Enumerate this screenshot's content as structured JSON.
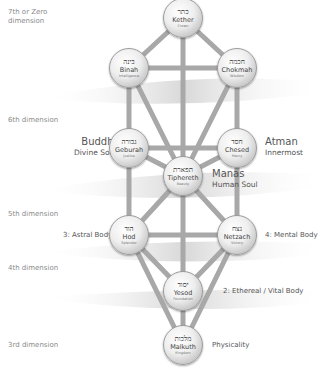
{
  "dimensions": [
    {
      "label": "7th or Zero\ndimension",
      "y": 13
    },
    {
      "label": "6th dimension",
      "y": 120
    },
    {
      "label": "5th dimension",
      "y": 214
    },
    {
      "label": "4th dimension",
      "y": 268
    },
    {
      "label": "3rd dimension",
      "y": 345
    }
  ],
  "sephiroth": [
    {
      "id": "kether",
      "hebrew": "כתר",
      "name": "Kether",
      "meaning": "Crown",
      "x": 183,
      "y": 18
    },
    {
      "id": "binah",
      "hebrew": "בינה",
      "name": "Binah",
      "meaning": "Intelligence",
      "x": 129,
      "y": 68
    },
    {
      "id": "chokmah",
      "hebrew": "חכמה",
      "name": "Chokmah",
      "meaning": "Wisdom",
      "x": 237,
      "y": 68
    },
    {
      "id": "geburah",
      "hebrew": "גבורה",
      "name": "Geburah",
      "meaning": "Justice",
      "x": 129,
      "y": 148
    },
    {
      "id": "chesed",
      "hebrew": "חסד",
      "name": "Chesed",
      "meaning": "Mercy",
      "x": 237,
      "y": 148
    },
    {
      "id": "tiphereth",
      "hebrew": "תפארת",
      "name": "Tiphereth",
      "meaning": "Beauty",
      "x": 183,
      "y": 176
    },
    {
      "id": "hod",
      "hebrew": "הוד",
      "name": "Hod",
      "meaning": "Splendor",
      "x": 129,
      "y": 235
    },
    {
      "id": "netzach",
      "hebrew": "נצח",
      "name": "Netzach",
      "meaning": "Victory",
      "x": 237,
      "y": 235
    },
    {
      "id": "yesod",
      "hebrew": "יסוד",
      "name": "Yesod",
      "meaning": "Foundation",
      "x": 183,
      "y": 291
    },
    {
      "id": "malkuth",
      "hebrew": "מלכות",
      "name": "Malkuth",
      "meaning": "Kingdom",
      "x": 183,
      "y": 345
    }
  ],
  "paths": [
    [
      "kether",
      "binah"
    ],
    [
      "kether",
      "chokmah"
    ],
    [
      "kether",
      "tiphereth"
    ],
    [
      "binah",
      "chokmah"
    ],
    [
      "binah",
      "geburah"
    ],
    [
      "binah",
      "tiphereth"
    ],
    [
      "chokmah",
      "chesed"
    ],
    [
      "chokmah",
      "tiphereth"
    ],
    [
      "geburah",
      "chesed"
    ],
    [
      "geburah",
      "tiphereth"
    ],
    [
      "geburah",
      "hod"
    ],
    [
      "chesed",
      "tiphereth"
    ],
    [
      "chesed",
      "netzach"
    ],
    [
      "tiphereth",
      "hod"
    ],
    [
      "tiphereth",
      "netzach"
    ],
    [
      "tiphereth",
      "yesod"
    ],
    [
      "hod",
      "netzach"
    ],
    [
      "hod",
      "yesod"
    ],
    [
      "hod",
      "malkuth"
    ],
    [
      "netzach",
      "yesod"
    ],
    [
      "netzach",
      "malkuth"
    ],
    [
      "yesod",
      "malkuth"
    ]
  ],
  "labels": {
    "buddhi": {
      "big": "Buddhi",
      "small": "Divine Soul"
    },
    "atman": {
      "big": "Atman",
      "small": "Innermost"
    },
    "manas": {
      "big": "Manas",
      "small": "Human Soul"
    },
    "astral": "3: Astral Body",
    "mental": "4: Mental Body",
    "ethereal": "2: Ethereal / Vital Body",
    "physicality": "Physicality"
  },
  "colors": {
    "path": "#a8a8a8",
    "band": "#d9d9d9",
    "dim_text": "#8a8a8a"
  }
}
